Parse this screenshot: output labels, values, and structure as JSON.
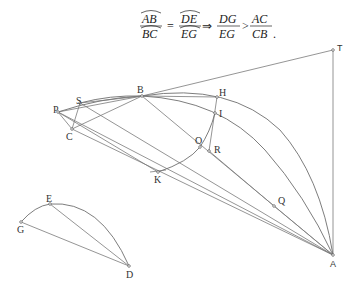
{
  "formula": {
    "frac1_num": "AB",
    "frac1_den": "BC",
    "eq": "=",
    "frac2_num": "DE",
    "frac2_den": "EG",
    "implies": "⇒",
    "frac3_num": "DG",
    "frac3_den": "EG",
    "gt": ">",
    "frac4_num": "AC",
    "frac4_den": "CB",
    "end": "."
  },
  "points": {
    "T": {
      "label": "T",
      "x": 333,
      "y": 50
    },
    "B": {
      "label": "B",
      "x": 142,
      "y": 96
    },
    "H": {
      "label": "H",
      "x": 217,
      "y": 97
    },
    "I": {
      "label": "I",
      "x": 215,
      "y": 113
    },
    "S": {
      "label": "S",
      "x": 80,
      "y": 103
    },
    "P": {
      "label": "P",
      "x": 58,
      "y": 112
    },
    "C": {
      "label": "C",
      "x": 72,
      "y": 129
    },
    "O": {
      "label": "O",
      "x": 200,
      "y": 147
    },
    "R": {
      "label": "R",
      "x": 209,
      "y": 151
    },
    "K": {
      "label": "K",
      "x": 158,
      "y": 172
    },
    "Q": {
      "label": "Q",
      "x": 274,
      "y": 206
    },
    "A": {
      "label": "A",
      "x": 333,
      "y": 255
    },
    "E": {
      "label": "E",
      "x": 50,
      "y": 204
    },
    "G": {
      "label": "G",
      "x": 21,
      "y": 222
    },
    "D": {
      "label": "D",
      "x": 129,
      "y": 266
    }
  }
}
